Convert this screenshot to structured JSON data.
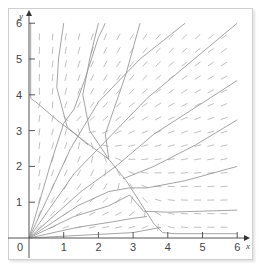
{
  "chart_data": {
    "type": "line",
    "title": "",
    "subtitle": "Direction field with phase-plane trajectories",
    "xlabel": "x",
    "ylabel": "y",
    "xlim": [
      0,
      6
    ],
    "ylim": [
      0,
      6
    ],
    "x_ticks": [
      "0",
      "1",
      "2",
      "3",
      "4",
      "5",
      "6"
    ],
    "y_ticks": [
      "1",
      "2",
      "3",
      "4",
      "5",
      "6"
    ],
    "origin_label": "0",
    "grid": false,
    "legend": null,
    "colors": {
      "trajectory": "#9a9a9a",
      "arrow": "#b0b0b0",
      "axis": "#555555",
      "frame": "#cfcfcf"
    },
    "direction_field": {
      "x_start": 0.3,
      "x_step": 0.38,
      "y_start": 0.3,
      "y_step": 0.38,
      "count_x": 15,
      "count_y": 15
    },
    "series": [
      {
        "name": "separatrix-top",
        "points": [
          [
            0.05,
            6
          ],
          [
            0.05,
            3.9
          ],
          [
            0.2,
            3.8
          ],
          [
            0.8,
            3.3
          ],
          [
            1.6,
            2.7
          ],
          [
            2.3,
            2.2
          ],
          [
            2.8,
            1.6
          ],
          [
            3.2,
            1.0
          ],
          [
            3.6,
            0.4
          ],
          [
            3.85,
            0.15
          ],
          [
            4.2,
            0.12
          ],
          [
            6,
            0.12
          ]
        ]
      },
      {
        "name": "traj-top-1",
        "points": [
          [
            1.0,
            6
          ],
          [
            0.85,
            5.0
          ],
          [
            0.8,
            4.2
          ],
          [
            1.1,
            3.1
          ],
          [
            1.7,
            2.6
          ]
        ]
      },
      {
        "name": "traj-top-2",
        "points": [
          [
            2.0,
            6
          ],
          [
            1.75,
            5.0
          ],
          [
            1.55,
            4.0
          ],
          [
            1.75,
            3.0
          ],
          [
            2.3,
            2.2
          ]
        ]
      },
      {
        "name": "traj-top-3",
        "points": [
          [
            3.2,
            6
          ],
          [
            2.8,
            4.6
          ],
          [
            2.2,
            2.9
          ],
          [
            2.3,
            2.2
          ]
        ]
      },
      {
        "name": "traj-diag-1",
        "points": [
          [
            0,
            0
          ],
          [
            0.6,
            2.0
          ],
          [
            1.0,
            3.2
          ],
          [
            1.3,
            3.6
          ],
          [
            1.6,
            4.4
          ],
          [
            2.0,
            5.6
          ],
          [
            2.2,
            6
          ]
        ]
      },
      {
        "name": "traj-diag-2",
        "points": [
          [
            0,
            0
          ],
          [
            1.2,
            2.5
          ],
          [
            2.0,
            3.8
          ],
          [
            3.2,
            5.0
          ],
          [
            4.5,
            6
          ]
        ]
      },
      {
        "name": "traj-diag-3",
        "points": [
          [
            0,
            0
          ],
          [
            1.3,
            1.8
          ],
          [
            2.4,
            2.9
          ],
          [
            3.4,
            3.9
          ],
          [
            6,
            6
          ]
        ]
      },
      {
        "name": "traj-diag-4",
        "points": [
          [
            0,
            0
          ],
          [
            1.5,
            1.3
          ],
          [
            2.5,
            2.0
          ],
          [
            3.6,
            2.9
          ],
          [
            6,
            4.4
          ]
        ]
      },
      {
        "name": "traj-diag-5",
        "points": [
          [
            0,
            0
          ],
          [
            1.4,
            0.9
          ],
          [
            2.3,
            1.3
          ],
          [
            2.9,
            1.4
          ],
          [
            3.4,
            1.4
          ],
          [
            4.5,
            1.6
          ],
          [
            6,
            2.0
          ]
        ]
      },
      {
        "name": "traj-diag-6",
        "points": [
          [
            0,
            0
          ],
          [
            1.3,
            0.6
          ],
          [
            2.3,
            0.9
          ],
          [
            2.9,
            1.2
          ],
          [
            3.3,
            0.75
          ],
          [
            4.0,
            0.72
          ],
          [
            6,
            0.78
          ]
        ]
      },
      {
        "name": "traj-diag-7",
        "points": [
          [
            0,
            0
          ],
          [
            1.4,
            0.3
          ],
          [
            2.4,
            0.45
          ],
          [
            3.0,
            0.55
          ],
          [
            3.4,
            0.6
          ]
        ]
      },
      {
        "name": "traj-right-1",
        "points": [
          [
            6,
            3.3
          ],
          [
            4.8,
            2.6
          ],
          [
            3.6,
            2.0
          ],
          [
            2.7,
            1.65
          ]
        ]
      },
      {
        "name": "traj-near-x",
        "points": [
          [
            0,
            0
          ],
          [
            2.0,
            0.1
          ],
          [
            3.0,
            0.15
          ],
          [
            3.8,
            0.3
          ]
        ]
      }
    ]
  }
}
